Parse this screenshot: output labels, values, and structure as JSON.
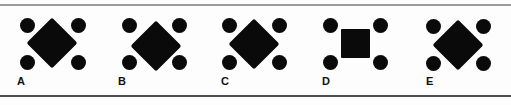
{
  "figure": {
    "width": 511,
    "height": 105,
    "background_color": "#fdfdfd",
    "shape_color": "#0a0a0a",
    "rules": [
      {
        "name": "top-rule",
        "y": 4,
        "thickness": 2,
        "color": "#9a9a9a"
      },
      {
        "name": "bottom-rule",
        "y": 95,
        "thickness": 2,
        "color": "#4e4e4e"
      }
    ]
  },
  "items": [
    {
      "label": "A",
      "label_x": 17,
      "label_y": 76,
      "group_x": 0,
      "center_shape": "diamond",
      "center_size": 36,
      "center_cx": 52,
      "center_cy": 43,
      "dot_diameter": 15,
      "dots": [
        {
          "cx": 27,
          "cy": 25
        },
        {
          "cx": 78,
          "cy": 25
        },
        {
          "cx": 27,
          "cy": 62
        },
        {
          "cx": 78,
          "cy": 62
        }
      ]
    },
    {
      "label": "B",
      "label_x": 118,
      "label_y": 76,
      "group_x": 101,
      "center_shape": "diamond",
      "center_size": 36,
      "center_cx": 55,
      "center_cy": 46,
      "dot_diameter": 15,
      "dots": [
        {
          "cx": 28,
          "cy": 25
        },
        {
          "cx": 78,
          "cy": 25
        },
        {
          "cx": 28,
          "cy": 62
        },
        {
          "cx": 78,
          "cy": 62
        }
      ]
    },
    {
      "label": "C",
      "label_x": 221,
      "label_y": 76,
      "group_x": 203,
      "center_shape": "diamond",
      "center_size": 36,
      "center_cx": 51,
      "center_cy": 44,
      "dot_diameter": 15,
      "dots": [
        {
          "cx": 26,
          "cy": 25
        },
        {
          "cx": 76,
          "cy": 25
        },
        {
          "cx": 26,
          "cy": 62
        },
        {
          "cx": 76,
          "cy": 62
        }
      ]
    },
    {
      "label": "D",
      "label_x": 322,
      "label_y": 76,
      "group_x": 304,
      "center_shape": "square",
      "center_size": 29,
      "center_cx": 51,
      "center_cy": 43,
      "dot_diameter": 15,
      "dots": [
        {
          "cx": 26,
          "cy": 25
        },
        {
          "cx": 76,
          "cy": 25
        },
        {
          "cx": 26,
          "cy": 62
        },
        {
          "cx": 76,
          "cy": 62
        }
      ]
    },
    {
      "label": "E",
      "label_x": 426,
      "label_y": 76,
      "group_x": 406,
      "center_shape": "diamond",
      "center_size": 36,
      "center_cx": 52,
      "center_cy": 45,
      "dot_diameter": 15,
      "dots": [
        {
          "cx": 27,
          "cy": 26
        },
        {
          "cx": 77,
          "cy": 26
        },
        {
          "cx": 27,
          "cy": 63
        },
        {
          "cx": 77,
          "cy": 63
        }
      ]
    }
  ]
}
